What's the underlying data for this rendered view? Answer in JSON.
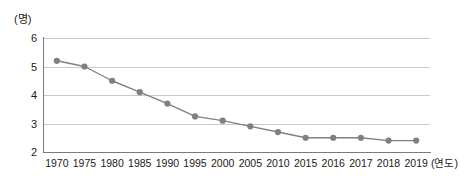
{
  "chart_data": {
    "type": "line",
    "title": "",
    "subtitle": "",
    "xlabel": "(연도)",
    "ylabel": "(명)",
    "categories": [
      "1970",
      "1975",
      "1980",
      "1985",
      "1990",
      "1995",
      "2000",
      "2005",
      "2010",
      "2015",
      "2016",
      "2017",
      "2018",
      "2019"
    ],
    "values": [
      5.2,
      5.0,
      4.5,
      4.1,
      3.7,
      3.25,
      3.1,
      2.9,
      2.7,
      2.5,
      2.5,
      2.5,
      2.4,
      2.4
    ],
    "series": [
      {
        "name": "",
        "values": [
          5.2,
          5.0,
          4.5,
          4.1,
          3.7,
          3.25,
          3.1,
          2.9,
          2.7,
          2.5,
          2.5,
          2.5,
          2.4,
          2.4
        ]
      }
    ],
    "ylim": [
      2,
      6
    ],
    "yticks": [
      "6",
      "5",
      "4",
      "3",
      "2"
    ],
    "ytick_values": [
      6,
      5,
      4,
      3,
      2
    ],
    "grid": true,
    "legend": "none",
    "marker": "circle",
    "colors": {
      "line": "#808080",
      "marker": "#808080",
      "gridline": "#c9c9c9",
      "axis": "#7a7a7a",
      "text": "#1a1a1a",
      "background": "#ffffff"
    }
  }
}
